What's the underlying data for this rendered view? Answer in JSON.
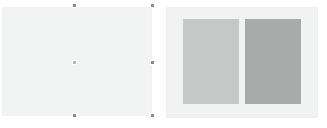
{
  "workspace": {
    "name": "slide-comparison-canvas",
    "background_color": "#ffffff"
  },
  "slides": [
    {
      "id": "slide-left",
      "label": "Blank slide",
      "state": "selected",
      "background_color": "#f2f3f3",
      "border_color": "#f0f1f1",
      "x": 2,
      "y": 7,
      "width": 150,
      "height": 109,
      "content_blocks": []
    },
    {
      "id": "slide-right",
      "label": "Two content slide",
      "state": "unselected",
      "background_color": "#f1f2f2",
      "border_color": "#eeefef",
      "x": 166,
      "y": 7,
      "width": 152,
      "height": 111,
      "content_blocks": [
        {
          "id": "placeholder-a",
          "label": "Left content placeholder",
          "fill_color": "#c6c7c7",
          "x": 16,
          "y": 11,
          "width": 56,
          "height": 85
        },
        {
          "id": "placeholder-b",
          "label": "Right content placeholder",
          "fill_color": "#a9aaaa",
          "x": 78,
          "y": 11,
          "width": 56,
          "height": 85
        }
      ]
    }
  ],
  "selection": {
    "target": "slide-left",
    "handle_color": "#8a8a8a",
    "handle_color_faint": "#b9b9b9",
    "handles": [
      {
        "id": "handle-top-center",
        "label": "Top center resize handle",
        "x": 74,
        "y": 5,
        "faint": false
      },
      {
        "id": "handle-top-right",
        "label": "Top right resize handle",
        "x": 152,
        "y": 5,
        "faint": false
      },
      {
        "id": "handle-middle-right",
        "label": "Middle right resize handle",
        "x": 152,
        "y": 62,
        "faint": false
      },
      {
        "id": "handle-center",
        "label": "Center move handle",
        "x": 74,
        "y": 62,
        "faint": true
      },
      {
        "id": "handle-bottom-center",
        "label": "Bottom center resize handle",
        "x": 74,
        "y": 115,
        "faint": false
      },
      {
        "id": "handle-bottom-right",
        "label": "Bottom right resize handle",
        "x": 152,
        "y": 115,
        "faint": false
      }
    ]
  }
}
